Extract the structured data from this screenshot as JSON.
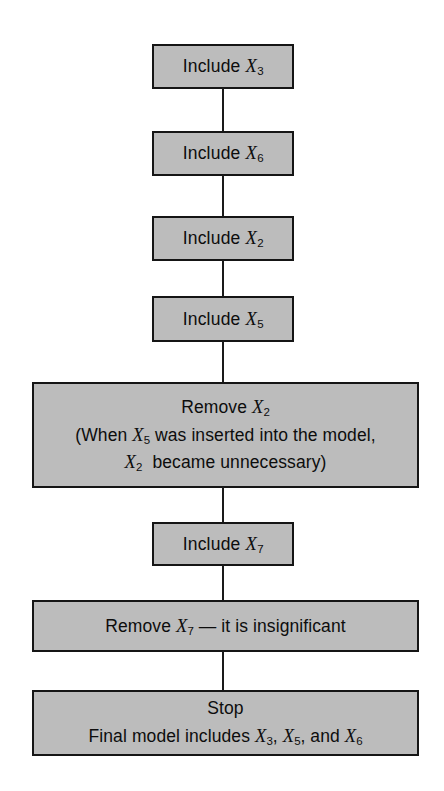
{
  "diagram": {
    "background_color": "#ffffff",
    "node_fill_color": "#bcbcbc",
    "node_border_color": "#151515",
    "text_color": "#0d0d0d"
  },
  "nodes": [
    {
      "id": "include-x3",
      "shape": "rectangle",
      "size": "small",
      "lines": [
        {
          "prefix": "Include ",
          "variable": "X",
          "subscript": "3",
          "suffix": ""
        }
      ],
      "plain_text": "Include X3"
    },
    {
      "id": "include-x6",
      "shape": "rectangle",
      "size": "small",
      "lines": [
        {
          "prefix": "Include ",
          "variable": "X",
          "subscript": "6",
          "suffix": ""
        }
      ],
      "plain_text": "Include X6"
    },
    {
      "id": "include-x2",
      "shape": "rectangle",
      "size": "small",
      "lines": [
        {
          "prefix": "Include ",
          "variable": "X",
          "subscript": "2",
          "suffix": ""
        }
      ],
      "plain_text": "Include X2"
    },
    {
      "id": "include-x5",
      "shape": "rectangle",
      "size": "small",
      "lines": [
        {
          "prefix": "Include ",
          "variable": "X",
          "subscript": "5",
          "suffix": ""
        }
      ],
      "plain_text": "Include X5"
    },
    {
      "id": "remove-x2",
      "shape": "rectangle",
      "size": "wide",
      "lines": [
        {
          "prefix": "Remove ",
          "variable": "X",
          "subscript": "2",
          "suffix": ""
        },
        {
          "prefix": "(When ",
          "variable": "X",
          "subscript": "5",
          "suffix": " was inserted into the model,"
        },
        {
          "prefix": "",
          "variable": "X",
          "subscript": "2",
          "suffix": " became unnecessary)"
        }
      ],
      "plain_text": "Remove X2 (When X5 was inserted into the model, X2 became unnecessary)"
    },
    {
      "id": "include-x7",
      "shape": "rectangle",
      "size": "small",
      "lines": [
        {
          "prefix": "Include ",
          "variable": "X",
          "subscript": "7",
          "suffix": ""
        }
      ],
      "plain_text": "Include X7"
    },
    {
      "id": "remove-x7",
      "shape": "rectangle",
      "size": "wide",
      "lines": [
        {
          "prefix": "Remove ",
          "variable": "X",
          "subscript": "7",
          "suffix": " — it is insignificant"
        }
      ],
      "plain_text": "Remove X7 — it is insignificant"
    },
    {
      "id": "stop",
      "shape": "rectangle",
      "size": "wide",
      "lines": [
        {
          "prefix": "Stop",
          "variable": "",
          "subscript": "",
          "suffix": ""
        },
        {
          "prefix": "Final model includes ",
          "variable": "X",
          "subscript": "3",
          "suffix": ",",
          "extra": [
            {
              "variable": "X",
              "subscript": "5",
              "suffix": ", and "
            },
            {
              "variable": "X",
              "subscript": "6",
              "suffix": ""
            }
          ]
        }
      ],
      "plain_text": "Stop Final model includes X3, X5, and X6"
    }
  ],
  "edges": [
    {
      "id": "conn-1",
      "from": "include-x3",
      "to": "include-x6"
    },
    {
      "id": "conn-2",
      "from": "include-x6",
      "to": "include-x2"
    },
    {
      "id": "conn-3",
      "from": "include-x2",
      "to": "include-x5"
    },
    {
      "id": "conn-4",
      "from": "include-x5",
      "to": "remove-x2"
    },
    {
      "id": "conn-5",
      "from": "remove-x2",
      "to": "include-x7"
    },
    {
      "id": "conn-6",
      "from": "include-x7",
      "to": "remove-x7"
    },
    {
      "id": "conn-7",
      "from": "remove-x7",
      "to": "stop"
    }
  ],
  "text": {
    "include_x3_l1_prefix": "Include ",
    "include_x3_var": "X",
    "include_x3_sub": "3",
    "include_x6_l1_prefix": "Include ",
    "include_x6_var": "X",
    "include_x6_sub": "6",
    "include_x2_l1_prefix": "Include ",
    "include_x2_var": "X",
    "include_x2_sub": "2",
    "include_x5_l1_prefix": "Include ",
    "include_x5_var": "X",
    "include_x5_sub": "5",
    "remove_x2_l1_prefix": "Remove ",
    "remove_x2_l1_var": "X",
    "remove_x2_l1_sub": "2",
    "remove_x2_l2_prefix": "(When ",
    "remove_x2_l2_var": "X",
    "remove_x2_l2_sub": "5",
    "remove_x2_l2_suffix": " was inserted into the model,",
    "remove_x2_l3_var": "X",
    "remove_x2_l3_sub": "2",
    "remove_x2_l3_suffix": " became unnecessary)",
    "include_x7_l1_prefix": "Include ",
    "include_x7_var": "X",
    "include_x7_sub": "7",
    "remove_x7_prefix": "Remove ",
    "remove_x7_var": "X",
    "remove_x7_sub": "7",
    "remove_x7_suffix": " — it is insignificant",
    "stop_l1": "Stop",
    "stop_l2_prefix": "Final model includes ",
    "stop_l2_var1": "X",
    "stop_l2_sub1": "3",
    "stop_l2_mid1": ", ",
    "stop_l2_var2": "X",
    "stop_l2_sub2": "5",
    "stop_l2_mid2": ", and ",
    "stop_l2_var3": "X",
    "stop_l2_sub3": "6"
  }
}
